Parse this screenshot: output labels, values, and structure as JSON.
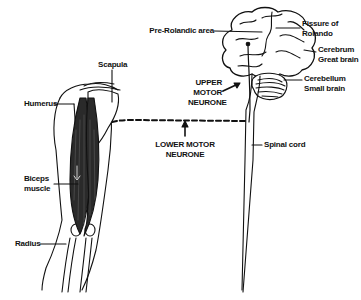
{
  "diagram": {
    "labels": {
      "pre_rolandic": "Pre-Rolandic area",
      "fissure_line1": "Fissure of",
      "fissure_line2": "Rolando",
      "cerebrum_line1": "Cerebrum",
      "cerebrum_line2": "Great brain",
      "cerebellum_line1": "Cerebellum",
      "cerebellum_line2": "Small brain",
      "upper_line1": "UPPER",
      "upper_line2": "MOTOR",
      "upper_line3": "NEURONE",
      "lower_line1": "LOWER MOTOR",
      "lower_line2": "NEURONE",
      "spinal_cord": "Spinal cord",
      "scapula": "Scapula",
      "humerus": "Humerus",
      "biceps_line1": "Biceps",
      "biceps_line2": "muscle",
      "radius": "Radius"
    },
    "colors": {
      "ink": "#111111",
      "background": "#ffffff",
      "muscle": "#2a2a2a"
    }
  }
}
